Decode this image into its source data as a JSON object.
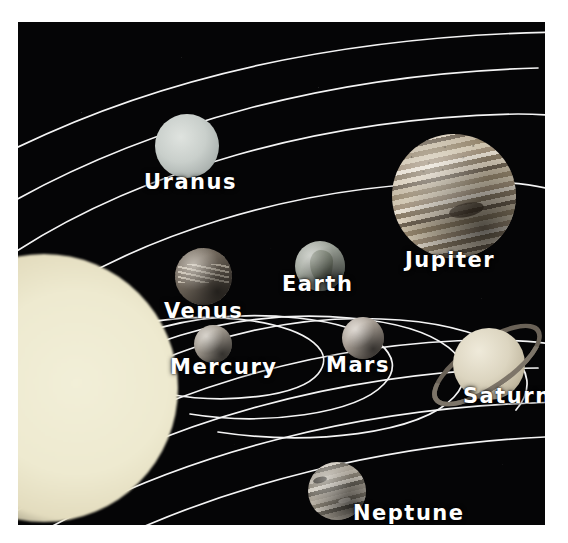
{
  "poster": {
    "kind": "solar-system-diagram",
    "background_color": "#050506",
    "orbit_line_color": "#f2f2f2",
    "label_color": "#ffffff",
    "frame_color": "#ffffff"
  },
  "sun": {
    "name": "Sun",
    "color": "#eeead0"
  },
  "planets": [
    {
      "id": "mercury",
      "label": "Mercury",
      "color": "#9b948a",
      "order": 1
    },
    {
      "id": "venus",
      "label": "Venus",
      "color": "#6d6459",
      "order": 2
    },
    {
      "id": "earth",
      "label": "Earth",
      "color": "#9aa096",
      "order": 3
    },
    {
      "id": "mars",
      "label": "Mars",
      "color": "#a39a90",
      "order": 4
    },
    {
      "id": "jupiter",
      "label": "Jupiter",
      "color": "#cfc4ae",
      "order": 5
    },
    {
      "id": "saturn",
      "label": "Saturn",
      "color": "#dcd5c0",
      "order": 6
    },
    {
      "id": "uranus",
      "label": "Uranus",
      "color": "#c9cfcb",
      "order": 7
    },
    {
      "id": "neptune",
      "label": "Neptune",
      "color": "#b9b2a6",
      "order": 8
    }
  ],
  "labels": {
    "mercury": "Mercury",
    "venus": "Venus",
    "earth": "Earth",
    "mars": "Mars",
    "jupiter": "Jupiter",
    "saturn": "Saturn",
    "uranus": "Uranus",
    "neptune": "Neptune"
  },
  "orbits": {
    "count": 8,
    "description": "eight concentric elliptical orbit arcs sweeping from lower-left to upper-right"
  }
}
